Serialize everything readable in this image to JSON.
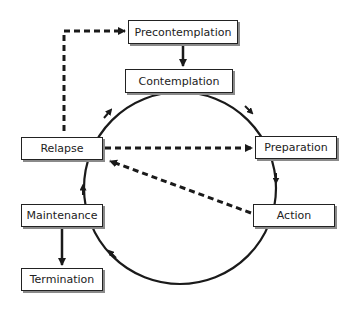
{
  "diagram": {
    "type": "cycle-flowchart",
    "stages": [
      {
        "id": "precontemplation",
        "label": "Precontemplation"
      },
      {
        "id": "contemplation",
        "label": "Contemplation"
      },
      {
        "id": "preparation",
        "label": "Preparation"
      },
      {
        "id": "action",
        "label": "Action"
      },
      {
        "id": "maintenance",
        "label": "Maintenance"
      },
      {
        "id": "relapse",
        "label": "Relapse"
      },
      {
        "id": "termination",
        "label": "Termination"
      }
    ],
    "edges": [
      {
        "from": "precontemplation",
        "to": "contemplation",
        "style": "solid"
      },
      {
        "from": "contemplation",
        "to": "preparation",
        "style": "solid-curved"
      },
      {
        "from": "preparation",
        "to": "action",
        "style": "solid-curved"
      },
      {
        "from": "action",
        "to": "maintenance",
        "style": "solid-curved"
      },
      {
        "from": "maintenance",
        "to": "relapse",
        "style": "solid-curved"
      },
      {
        "from": "relapse",
        "to": "contemplation",
        "style": "solid-curved"
      },
      {
        "from": "maintenance",
        "to": "termination",
        "style": "solid"
      },
      {
        "from": "relapse",
        "to": "precontemplation",
        "style": "dashed"
      },
      {
        "from": "relapse",
        "to": "preparation",
        "style": "dashed"
      },
      {
        "from": "action",
        "to": "relapse",
        "style": "dashed"
      }
    ],
    "colors": {
      "line": "#1a1a1a",
      "shadow": "#8a8a8a",
      "background": "#ffffff"
    }
  }
}
